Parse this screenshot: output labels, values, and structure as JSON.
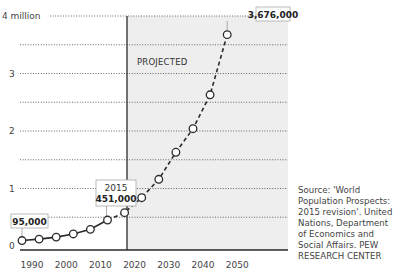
{
  "chart_data": {
    "type": "line",
    "title": "",
    "xlabel": "",
    "ylabel": "",
    "ylim": [
      0,
      4000000
    ],
    "xlim": [
      1990,
      2050
    ],
    "yticks": [
      "0",
      "1",
      "2",
      "3",
      "4 million"
    ],
    "xticks": [
      "1990",
      "2000",
      "2010",
      "2020",
      "2030",
      "2040",
      "2050"
    ],
    "grid": true,
    "projection_start": 2015,
    "projected_label": "PROJECTED",
    "series": [
      {
        "name": "Historical",
        "style": "solid",
        "x": [
          1990,
          1995,
          2000,
          2005,
          2010,
          2015
        ],
        "values": [
          95000,
          120000,
          155000,
          210000,
          290000,
          451000
        ]
      },
      {
        "name": "Projected",
        "style": "dashed",
        "x": [
          2015,
          2020,
          2025,
          2030,
          2035,
          2040,
          2045,
          2050
        ],
        "values": [
          451000,
          580000,
          840000,
          1160000,
          1630000,
          2040000,
          2630000,
          3676000
        ]
      }
    ],
    "annotations": [
      {
        "x": 1990,
        "label": "95,000"
      },
      {
        "x": 2015,
        "year": "2015",
        "label": "451,000"
      },
      {
        "x": 2050,
        "label": "3,676,000"
      }
    ]
  },
  "source_text": "Source: 'World Population Prospects: 2015 revision'. United Nations, Department of Economics and Social Affairs. PEW RESEARCH CENTER",
  "colors": {
    "projected_bg": "#eeeeee",
    "line": "#2a2a2a",
    "marker_fill": "#ffffff"
  }
}
